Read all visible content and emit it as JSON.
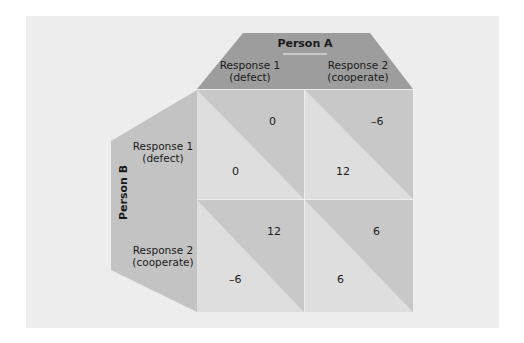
{
  "diagram": {
    "type": "payoff-matrix",
    "colors": {
      "panel_bg": "#ededed",
      "header_dark": "#9d9d9d",
      "side_mid": "#c3c3c3",
      "cell_dark": "#c8c8c8",
      "cell_light": "#dedede"
    },
    "person_a": {
      "title": "Person A",
      "columns": [
        {
          "line1": "Response 1",
          "line2": "(defect)"
        },
        {
          "line1": "Response 2",
          "line2": "(cooperate)"
        }
      ]
    },
    "person_b": {
      "title": "Person B",
      "rows": [
        {
          "line1": "Response 1",
          "line2": "(defect)"
        },
        {
          "line1": "Response 2",
          "line2": "(cooperate)"
        }
      ]
    },
    "cells": [
      [
        {
          "a": "0",
          "b": "0"
        },
        {
          "a": "–6",
          "b": "12"
        }
      ],
      [
        {
          "a": "12",
          "b": "–6"
        },
        {
          "a": "6",
          "b": "6"
        }
      ]
    ]
  }
}
